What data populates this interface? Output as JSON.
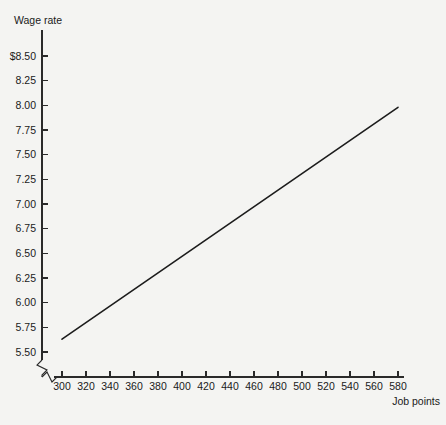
{
  "chart_data": {
    "type": "line",
    "title": "",
    "ylabel": "Wage rate",
    "xlabel": "Job points",
    "xlim": [
      300,
      580
    ],
    "ylim": [
      5.5,
      8.5
    ],
    "grid": false,
    "legend": "none",
    "axis_break_x": true,
    "axis_break_y": true,
    "xticks": [
      300,
      320,
      340,
      360,
      380,
      400,
      420,
      440,
      460,
      480,
      500,
      520,
      540,
      560,
      580
    ],
    "xticklabels": [
      "300",
      "320",
      "340",
      "360",
      "380",
      "400",
      "420",
      "440",
      "460",
      "480",
      "500",
      "520",
      "540",
      "560",
      "580"
    ],
    "yticks": [
      5.5,
      5.75,
      6.0,
      6.25,
      6.5,
      6.75,
      7.0,
      7.25,
      7.5,
      7.75,
      8.0,
      8.25,
      8.5
    ],
    "yticklabels": [
      "5.50",
      "5.75",
      "6.00",
      "6.25",
      "6.50",
      "6.75",
      "7.00",
      "7.25",
      "7.50",
      "7.75",
      "8.00",
      "8.25",
      "$8.50"
    ],
    "series": [
      {
        "name": "wage-line",
        "color": "#1c1c1c",
        "x": [
          300,
          580
        ],
        "values": [
          5.63,
          7.98
        ]
      }
    ],
    "annotations": []
  },
  "colors": {
    "background": "#f4f4f2",
    "axis": "#2a2a2a",
    "line": "#1c1c1c",
    "text": "#1a1a1a"
  }
}
